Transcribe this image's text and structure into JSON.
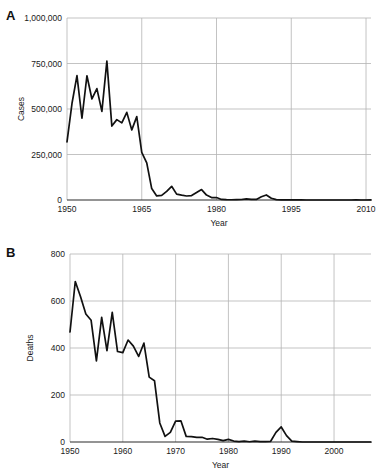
{
  "figure": {
    "background": "#ffffff",
    "line_color": "#111111",
    "grid_color": "#b4b4b4",
    "axis_color": "#2b2b2b"
  },
  "panels": [
    {
      "label": "A",
      "chart_data": {
        "type": "line",
        "title": "",
        "xlabel": "Year",
        "ylabel": "Cases",
        "xlim": [
          1950,
          2011
        ],
        "ylim": [
          0,
          1000000
        ],
        "grid": true,
        "legend": "none",
        "xticks": [
          1950,
          1965,
          1980,
          1995,
          2010
        ],
        "xtick_labels": [
          "1950",
          "1965",
          "1980",
          "1995",
          "2010"
        ],
        "yticks": [
          0,
          250000,
          500000,
          750000,
          1000000
        ],
        "ytick_labels": [
          "0",
          "250,000",
          "500,000",
          "750,000",
          "1,000,000"
        ],
        "x": [
          1950,
          1951,
          1952,
          1953,
          1954,
          1955,
          1956,
          1957,
          1958,
          1959,
          1960,
          1961,
          1962,
          1963,
          1964,
          1965,
          1966,
          1967,
          1968,
          1969,
          1970,
          1971,
          1972,
          1973,
          1974,
          1975,
          1976,
          1977,
          1978,
          1979,
          1980,
          1981,
          1982,
          1983,
          1984,
          1985,
          1986,
          1987,
          1988,
          1989,
          1990,
          1991,
          1992,
          1993,
          1994,
          1995,
          1996,
          1997,
          1998,
          1999,
          2000,
          2001,
          2002,
          2003,
          2004,
          2005,
          2006,
          2007,
          2008,
          2009,
          2010,
          2011
        ],
        "values": [
          319124,
          530118,
          683077,
          449146,
          682720,
          555156,
          611936,
          486799,
          763094,
          406162,
          441703,
          423919,
          481530,
          385156,
          458083,
          261904,
          204136,
          62705,
          22231,
          25826,
          47351,
          75290,
          32275,
          26690,
          22094,
          24374,
          41126,
          57345,
          26871,
          13597,
          13506,
          3124,
          1714,
          1497,
          2587,
          2822,
          6282,
          3655,
          3396,
          18193,
          27786,
          9643,
          2237,
          312,
          963,
          309,
          508,
          138,
          100,
          100,
          86,
          116,
          44,
          56,
          37,
          66,
          55,
          43,
          140,
          71,
          63,
          220
        ],
        "series": [
          {
            "name": "Measles cases",
            "values": [
              319124,
              530118,
              683077,
              449146,
              682720,
              555156,
              611936,
              486799,
              763094,
              406162,
              441703,
              423919,
              481530,
              385156,
              458083,
              261904,
              204136,
              62705,
              22231,
              25826,
              47351,
              75290,
              32275,
              26690,
              22094,
              24374,
              41126,
              57345,
              26871,
              13597,
              13506,
              3124,
              1714,
              1497,
              2587,
              2822,
              6282,
              3655,
              3396,
              18193,
              27786,
              9643,
              2237,
              312,
              963,
              309,
              508,
              138,
              100,
              100,
              86,
              116,
              44,
              56,
              37,
              66,
              55,
              43,
              140,
              71,
              63,
              220
            ]
          }
        ]
      }
    },
    {
      "label": "B",
      "chart_data": {
        "type": "line",
        "title": "",
        "xlabel": "Year",
        "ylabel": "Deaths",
        "xlim": [
          1950,
          2007
        ],
        "ylim": [
          0,
          800
        ],
        "grid": true,
        "legend": "none",
        "xticks": [
          1950,
          1960,
          1970,
          1980,
          1990,
          2000
        ],
        "xtick_labels": [
          "1950",
          "1960",
          "1970",
          "1980",
          "1990",
          "2000"
        ],
        "yticks": [
          0,
          200,
          400,
          600,
          800
        ],
        "ytick_labels": [
          "0",
          "200",
          "400",
          "600",
          "800"
        ],
        "x": [
          1950,
          1951,
          1952,
          1953,
          1954,
          1955,
          1956,
          1957,
          1958,
          1959,
          1960,
          1961,
          1962,
          1963,
          1964,
          1965,
          1966,
          1967,
          1968,
          1969,
          1970,
          1971,
          1972,
          1973,
          1974,
          1975,
          1976,
          1977,
          1978,
          1979,
          1980,
          1981,
          1982,
          1983,
          1984,
          1985,
          1986,
          1987,
          1988,
          1989,
          1990,
          1991,
          1992,
          1993,
          1994,
          1995,
          1996,
          1997,
          1998,
          1999,
          2000,
          2001,
          2002,
          2003,
          2004,
          2005,
          2006,
          2007
        ],
        "values": [
          468,
          683,
          618,
          545,
          518,
          345,
          530,
          389,
          552,
          385,
          380,
          434,
          408,
          364,
          421,
          276,
          261,
          81,
          24,
          41,
          89,
          90,
          24,
          23,
          20,
          20,
          12,
          15,
          11,
          6,
          11,
          4,
          2,
          4,
          1,
          4,
          2,
          2,
          3,
          41,
          64,
          27,
          4,
          2,
          0,
          0,
          0,
          0,
          0,
          0,
          0,
          0,
          0,
          0,
          0,
          0,
          0,
          0
        ],
        "series": [
          {
            "name": "Measles deaths",
            "values": [
              468,
              683,
              618,
              545,
              518,
              345,
              530,
              389,
              552,
              385,
              380,
              434,
              408,
              364,
              421,
              276,
              261,
              81,
              24,
              41,
              89,
              90,
              24,
              23,
              20,
              20,
              12,
              15,
              11,
              6,
              11,
              4,
              2,
              4,
              1,
              4,
              2,
              2,
              3,
              41,
              64,
              27,
              4,
              2,
              0,
              0,
              0,
              0,
              0,
              0,
              0,
              0,
              0,
              0,
              0,
              0,
              0,
              0
            ]
          }
        ]
      }
    }
  ]
}
